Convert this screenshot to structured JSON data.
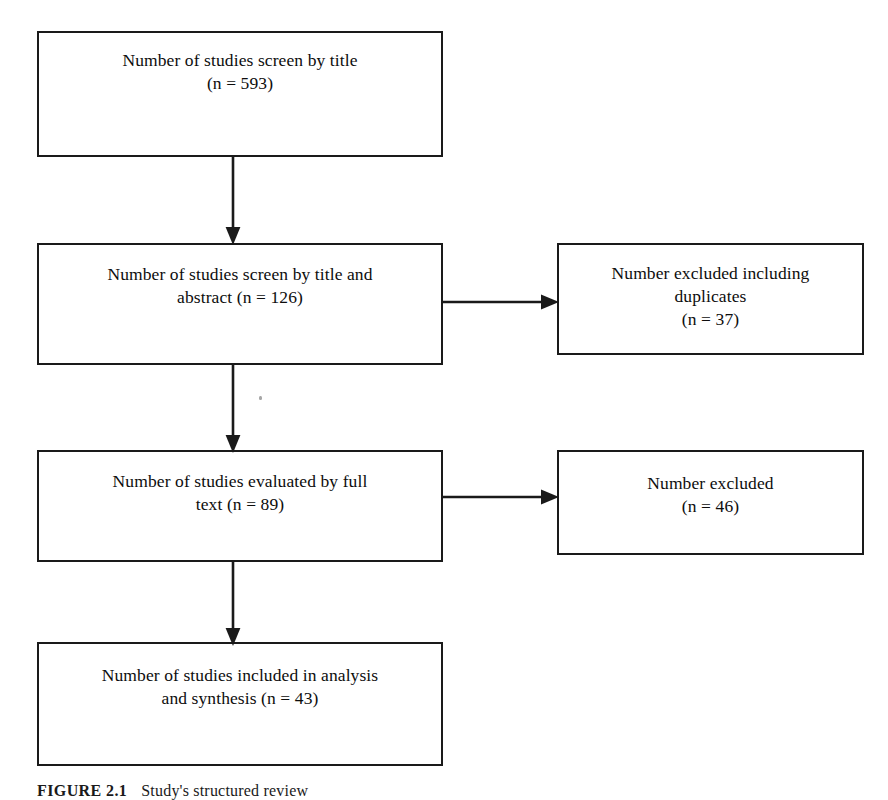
{
  "figure": {
    "caption_label": "FIGURE 2.1",
    "caption_text": "Study's structured review",
    "line_color": "#1a1a1a",
    "background_color": "#ffffff"
  },
  "flow": {
    "boxes": [
      {
        "id": "box-title",
        "text": "Number of studies screen by title\n(n = 593)",
        "count_label": "n = 593",
        "count": 593,
        "stage": "Screened by title",
        "column": "main"
      },
      {
        "id": "box-title-abstract",
        "text": "Number of studies screen by title and\nabstract (n = 126)",
        "count_label": "n = 126",
        "count": 126,
        "stage": "Screened by title and abstract",
        "column": "main"
      },
      {
        "id": "box-excluded-dup",
        "text": "Number excluded including\nduplicates\n(n = 37)",
        "count_label": "n = 37",
        "count": 37,
        "stage": "Excluded including duplicates",
        "column": "side"
      },
      {
        "id": "box-fulltext",
        "text": "Number of studies evaluated by full\ntext (n = 89)",
        "count_label": "n = 89",
        "count": 89,
        "stage": "Evaluated by full text",
        "column": "main"
      },
      {
        "id": "box-excluded-ft",
        "text": "Number excluded\n(n = 46)",
        "count_label": "n = 46",
        "count": 46,
        "stage": "Excluded after full text",
        "column": "side"
      },
      {
        "id": "box-included",
        "text": "Number of studies included in analysis\nand synthesis (n = 43)",
        "count_label": "n = 43",
        "count": 43,
        "stage": "Included in analysis and synthesis",
        "column": "main"
      }
    ],
    "connectors": [
      {
        "id": "arrow-title-to-abstract",
        "from": "box-title",
        "to": "box-title-abstract",
        "direction": "down"
      },
      {
        "id": "arrow-abstract-to-excluded-dup",
        "from": "box-title-abstract",
        "to": "box-excluded-dup",
        "direction": "right"
      },
      {
        "id": "arrow-abstract-to-fulltext",
        "from": "box-title-abstract",
        "to": "box-fulltext",
        "direction": "down"
      },
      {
        "id": "arrow-fulltext-to-excluded-ft",
        "from": "box-fulltext",
        "to": "box-excluded-ft",
        "direction": "right"
      },
      {
        "id": "arrow-fulltext-to-included",
        "from": "box-fulltext",
        "to": "box-included",
        "direction": "down"
      }
    ]
  }
}
